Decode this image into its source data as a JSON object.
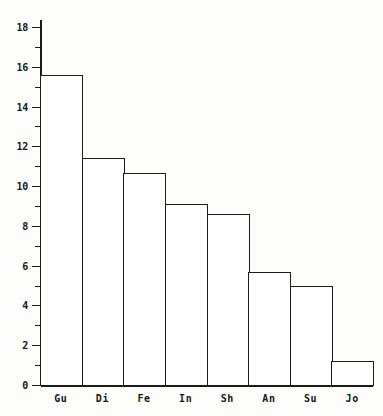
{
  "chart_data": {
    "type": "bar",
    "title": "",
    "subtitle": "",
    "xlabel": "",
    "ylabel": "",
    "categories": [
      "Gu",
      "Di",
      "Fe",
      "In",
      "Sh",
      "An",
      "Su",
      "Jo"
    ],
    "values": [
      15.6,
      11.4,
      10.65,
      9.1,
      8.6,
      5.7,
      5.0,
      1.2
    ],
    "series": [
      {
        "name": "",
        "values": [
          15.6,
          11.4,
          10.65,
          9.1,
          8.6,
          5.7,
          5.0,
          1.2
        ]
      }
    ],
    "ylim": [
      0,
      18.6
    ],
    "ytick_labels": [
      "0",
      "2",
      "4",
      "6",
      "8",
      "10",
      "12",
      "14",
      "16",
      "18"
    ],
    "ytick_values": [
      0,
      2,
      4,
      6,
      8,
      10,
      12,
      14,
      16,
      18
    ],
    "yminor_tick_values": [
      1,
      3,
      5,
      7,
      9,
      11,
      13,
      15,
      17
    ],
    "grid": false,
    "legend": null,
    "legend_position": "none",
    "annotations": [],
    "bar_fill_color": "#ffffff",
    "bar_edge_color": "#1b1b1b",
    "axis_color": "#1a1a1a",
    "background_color": "#fdfdfc"
  },
  "figure": {
    "plot_left_px": 40,
    "plot_right_px": 373,
    "plot_top_px": 20,
    "baseline_px": 385
  }
}
